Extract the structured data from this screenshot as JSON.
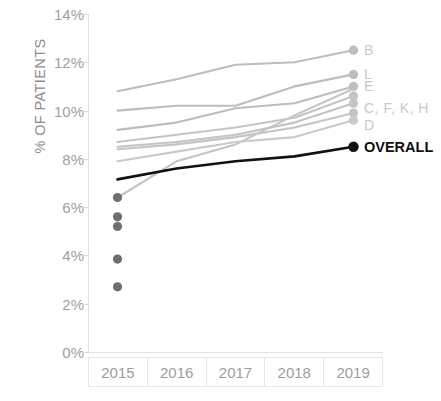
{
  "chart_data": {
    "type": "line",
    "title": "",
    "xlabel": "",
    "ylabel": "% OF PATIENTS",
    "categories": [
      "2015",
      "2016",
      "2017",
      "2018",
      "2019"
    ],
    "ylim": [
      0,
      14
    ],
    "yticks": [
      "0%",
      "2%",
      "4%",
      "6%",
      "8%",
      "10%",
      "12%",
      "14%"
    ],
    "ytick_values": [
      0,
      2,
      4,
      6,
      8,
      10,
      12,
      14
    ],
    "grid": false,
    "legend_position": "right-end-of-line",
    "series": [
      {
        "name": "B",
        "label": "B",
        "color": "#bdbdbd",
        "x": [
          "2015",
          "2016",
          "2017",
          "2018",
          "2019"
        ],
        "values": [
          10.8,
          11.3,
          11.9,
          12.0,
          12.5
        ],
        "endpoint_marker": true
      },
      {
        "name": "L",
        "label": "L",
        "color": "#bdbdbd",
        "x": [
          "2015",
          "2016",
          "2017",
          "2018",
          "2019"
        ],
        "values": [
          10.0,
          10.2,
          10.2,
          11.0,
          11.5
        ],
        "endpoint_marker": true
      },
      {
        "name": "E",
        "label": "E",
        "color": "#bdbdbd",
        "x": [
          "2015",
          "2016",
          "2017",
          "2018",
          "2019"
        ],
        "values": [
          9.2,
          9.5,
          10.1,
          10.3,
          11.0
        ],
        "endpoint_marker": true
      },
      {
        "name": "C",
        "label": "C, F, K, H",
        "color": "#c4c4c4",
        "x": [
          "2015",
          "2016",
          "2017",
          "2018",
          "2019"
        ],
        "values": [
          8.7,
          9.0,
          9.3,
          9.7,
          10.6
        ],
        "endpoint_marker": true
      },
      {
        "name": "F",
        "label": "",
        "color": "#c4c4c4",
        "x": [
          "2015",
          "2016",
          "2017",
          "2018",
          "2019"
        ],
        "values": [
          8.5,
          8.7,
          9.0,
          9.5,
          10.3
        ],
        "endpoint_marker": true
      },
      {
        "name": "K",
        "label": "",
        "color": "#c4c4c4",
        "x": [
          "2015",
          "2016",
          "2017",
          "2018",
          "2019"
        ],
        "values": [
          8.4,
          8.6,
          8.9,
          9.3,
          9.9
        ],
        "endpoint_marker": true
      },
      {
        "name": "H",
        "label": "",
        "color": "#c4c4c4",
        "x": [
          "2015",
          "2016",
          "2017",
          "2018",
          "2019"
        ],
        "values": [
          6.4,
          7.9,
          8.6,
          9.8,
          10.9
        ],
        "endpoint_marker": false
      },
      {
        "name": "D",
        "label": "D",
        "color": "#c9c9c9",
        "x": [
          "2015",
          "2016",
          "2017",
          "2018",
          "2019"
        ],
        "values": [
          7.9,
          8.3,
          8.7,
          8.9,
          9.6
        ],
        "endpoint_marker": true
      },
      {
        "name": "OVERALL",
        "label": "OVERALL",
        "color": "#111111",
        "x": [
          "2015",
          "2016",
          "2017",
          "2018",
          "2019"
        ],
        "values": [
          7.15,
          7.6,
          7.9,
          8.1,
          8.5
        ],
        "endpoint_marker": true
      }
    ],
    "isolated_points": {
      "note": "single-year 2015 markers",
      "color": "#6e6e6e",
      "x": "2015",
      "values": [
        6.4,
        5.6,
        5.2,
        3.85,
        2.7
      ]
    }
  },
  "series_labels": [
    {
      "text": "B"
    },
    {
      "text": "L"
    },
    {
      "text": "E"
    },
    {
      "text": "C, F, K, H"
    },
    {
      "text": "D"
    },
    {
      "text": "OVERALL"
    }
  ]
}
